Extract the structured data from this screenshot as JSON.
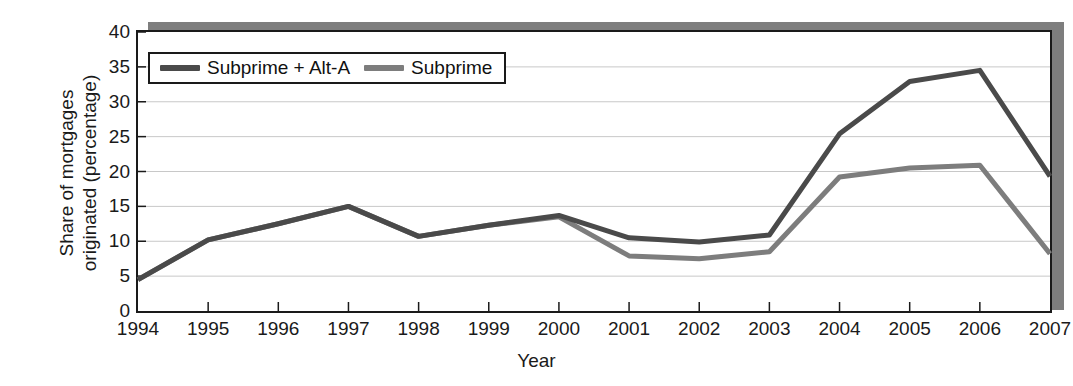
{
  "chart_data": {
    "type": "line",
    "title": "",
    "subtitle": "",
    "xlabel": "Year",
    "ylabel": "Share of mortgages originated (percentage)",
    "ylabel_line1": "Share of mortgages",
    "ylabel_line2": "originated (percentage)",
    "categories": [
      "1994",
      "1995",
      "1996",
      "1997",
      "1998",
      "1999",
      "2000",
      "2001",
      "2002",
      "2003",
      "2004",
      "2005",
      "2006",
      "2007"
    ],
    "x": [
      1994,
      1995,
      1996,
      1997,
      1998,
      1999,
      2000,
      2001,
      2002,
      2003,
      2004,
      2005,
      2006,
      2007
    ],
    "xlim": [
      1994,
      2007
    ],
    "ylim": [
      0,
      40
    ],
    "yticks": [
      0,
      5,
      10,
      15,
      20,
      25,
      30,
      35,
      40
    ],
    "ytick_labels": [
      "0",
      "5",
      "10",
      "15",
      "20",
      "25",
      "30",
      "35",
      "40"
    ],
    "grid": true,
    "grid_axis": "y",
    "legend_position": "top-left-inside",
    "series": [
      {
        "name": "Subprime + Alt-A",
        "color": "#4a4a4a",
        "values": [
          4.5,
          10.2,
          12.5,
          15.0,
          10.7,
          12.3,
          13.7,
          10.5,
          9.9,
          10.9,
          25.4,
          32.9,
          34.5,
          19.3
        ]
      },
      {
        "name": "Subprime",
        "color": "#7d7d7d",
        "values": [
          4.5,
          10.2,
          12.5,
          15.0,
          10.7,
          12.3,
          13.5,
          7.9,
          7.5,
          8.5,
          19.2,
          20.5,
          20.9,
          8.2
        ]
      }
    ]
  },
  "legend": {
    "entries": [
      {
        "label": "Subprime + Alt-A"
      },
      {
        "label": "Subprime"
      }
    ]
  },
  "colors": {
    "series_dark": "#4a4a4a",
    "series_light": "#7d7d7d",
    "axis": "#1a1a1a",
    "grid": "#c8c8c8",
    "shadow": "#7e7e7e",
    "background": "#ffffff"
  }
}
